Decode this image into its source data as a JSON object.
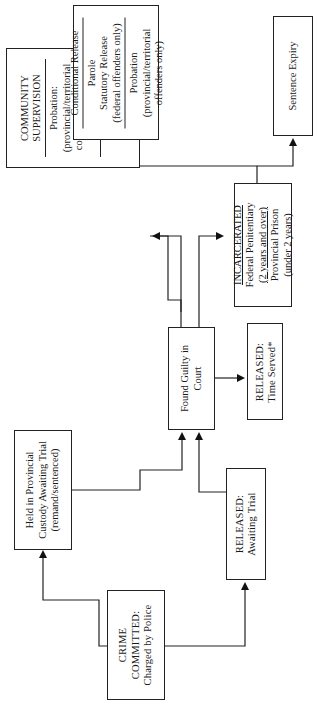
{
  "diagram": {
    "orientation": "rotated-90-ccw",
    "nodes": {
      "crime": {
        "lines": [
          "CRIME",
          "COMMITTED:",
          "Charged by Police"
        ]
      },
      "held": {
        "lines": [
          "Held in Provincial",
          "Custody Awaiting Trial",
          "(remand/sentenced)"
        ]
      },
      "released_trial": {
        "lines": [
          "RELEASED:",
          "Awaiting Trial"
        ]
      },
      "found_guilty": {
        "lines": [
          "Found Guilty in",
          "Court"
        ]
      },
      "released_served": {
        "lines": [
          "RELEASED:",
          "Time Served*"
        ]
      },
      "community": {
        "title": [
          "COMMUNITY",
          "SUPERVISION"
        ],
        "section1": [
          "Probation:",
          "(provincial/territorial",
          "correctional method",
          "only)"
        ],
        "section2": [
          "Conditional",
          "Sentence"
        ]
      },
      "incarcerated": {
        "title": "INCARCERATED",
        "section1": [
          "Federal Penitentiary",
          "(2 years and over)"
        ],
        "section2": [
          "Provincial Prison",
          "(under 2 years)"
        ]
      },
      "conditional": {
        "title": "Conditional Release",
        "section1": [
          "Parole",
          "Statutory Release",
          "(federal offenders only)"
        ],
        "section2": [
          "Probation",
          "(provincial/territorial",
          "offenders only)"
        ]
      },
      "expiry": {
        "lines": [
          "Sentence Expiry"
        ]
      }
    },
    "edges": [
      {
        "from": "crime",
        "to": "held"
      },
      {
        "from": "crime",
        "to": "released_trial"
      },
      {
        "from": "held",
        "to": "found_guilty"
      },
      {
        "from": "released_trial",
        "to": "found_guilty"
      },
      {
        "from": "found_guilty",
        "to": "community"
      },
      {
        "from": "found_guilty",
        "to": "incarcerated"
      },
      {
        "from": "found_guilty",
        "to": "released_served"
      },
      {
        "from": "incarcerated",
        "to": "conditional"
      },
      {
        "from": "incarcerated",
        "to": "expiry"
      }
    ]
  }
}
